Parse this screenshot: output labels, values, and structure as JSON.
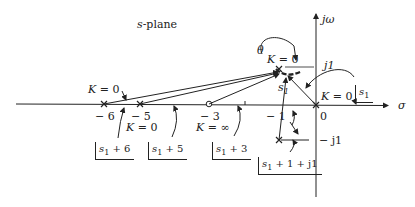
{
  "diagram": {
    "title": "s-plane",
    "axes": {
      "real_label": "σ",
      "imag_label": "jω",
      "j1_label": "j1",
      "neg_j1_label": "− j1"
    },
    "tick_labels": {
      "neg6": "− 6",
      "neg5": "− 5",
      "neg3": "− 3",
      "neg1": "− 1",
      "zero": "0"
    },
    "gain_labels": {
      "k0_pole_neg6": "K = 0",
      "k0_pole_neg5": "K = 0",
      "kinf_zero_neg3": "K = ∞",
      "k0_upper": "K = 0",
      "k0_origin": "K = 0"
    },
    "point_labels": {
      "s1": "s",
      "s1_sub": "1",
      "theta": "θ"
    },
    "angle_labels": {
      "s1": {
        "main": "s",
        "sub": "1",
        "rest": ""
      },
      "s1_plus_6": {
        "main": "s",
        "sub": "1",
        "rest": " + 6"
      },
      "s1_plus_5": {
        "main": "s",
        "sub": "1",
        "rest": " + 5"
      },
      "s1_plus_3": {
        "main": "s",
        "sub": "1",
        "rest": " + 3"
      },
      "s1_plus_1_plus_j1": {
        "main": "s",
        "sub": "1",
        "rest": " + 1 + j1"
      }
    },
    "poles": [
      {
        "label": "-6",
        "x": 104,
        "y": 104
      },
      {
        "label": "-5",
        "x": 140,
        "y": 104
      },
      {
        "label": "0",
        "x": 316,
        "y": 105
      },
      {
        "label": "-1+j1",
        "x": 279,
        "y": 69
      },
      {
        "label": "-1-j1",
        "x": 279,
        "y": 140
      }
    ],
    "zeros": [
      {
        "label": "-3",
        "x": 209,
        "y": 104
      }
    ],
    "colors": {
      "ink": "#222222",
      "background": "#ffffff"
    }
  }
}
